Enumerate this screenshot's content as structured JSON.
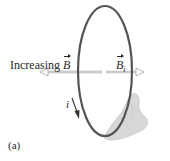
{
  "figure": {
    "panel_label": "(a)",
    "external_field_label": "Increasing",
    "external_field_symbol": "B",
    "induced_field_symbol": "B",
    "induced_field_subscript": "i",
    "current_symbol": "i"
  },
  "colors": {
    "loop": "#555555",
    "arrow_outline": "#aaaaaa",
    "hand": "#d8d8d8",
    "text": "#2a2a2a",
    "current_arrow": "#333333"
  }
}
